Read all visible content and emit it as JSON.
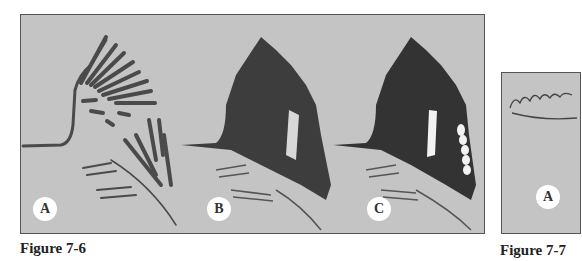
{
  "figures": [
    {
      "caption": "Figure 7-6",
      "panels": [
        {
          "label": "A",
          "description": "wing sketch with feather strokes outlined"
        },
        {
          "label": "B",
          "description": "wing shaded dark with light patch"
        },
        {
          "label": "C",
          "description": "wing shaded dark with white feather highlights"
        }
      ]
    },
    {
      "caption": "Figure 7-7",
      "panels": [
        {
          "label": "A",
          "description": "partial sketch of scalloped outline"
        }
      ]
    }
  ],
  "colors": {
    "panel_bg": "#c4c4c4",
    "stroke": "#3a3a3a",
    "highlight": "#f2f2f2"
  }
}
